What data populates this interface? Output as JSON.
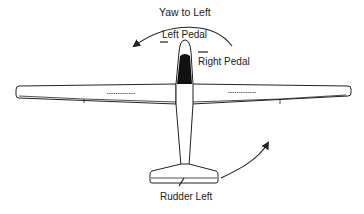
{
  "diagram": {
    "title": "Yaw to Left",
    "labels": {
      "left_pedal": "Left Pedal",
      "right_pedal": "Right Pedal",
      "rudder": "Rudder Left"
    },
    "colors": {
      "ink": "#222222",
      "background": "#ffffff",
      "fuselage_fill": "#111111"
    }
  }
}
